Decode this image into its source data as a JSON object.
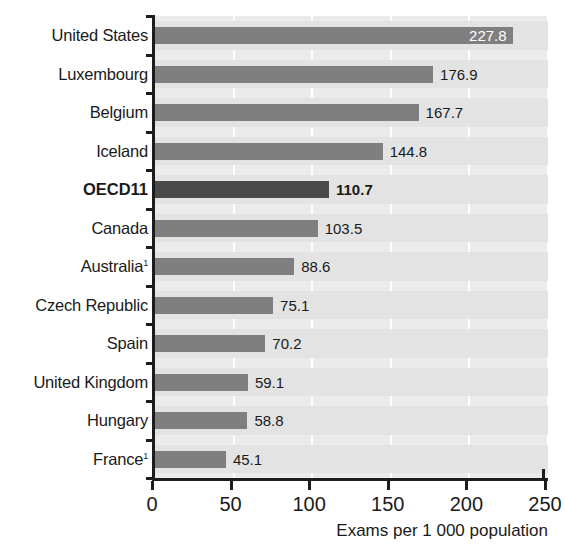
{
  "chart_data": {
    "type": "bar",
    "orientation": "horizontal",
    "title": "",
    "subtitle": "",
    "xlabel": "Exams per 1 000 population",
    "ylabel": "",
    "xlim": [
      0,
      250
    ],
    "xticks": [
      0,
      50,
      100,
      150,
      200,
      250
    ],
    "xtick_labels": [
      "0",
      "50",
      "100",
      "150",
      "200",
      "250"
    ],
    "grid": "vertical-white-gridlines",
    "legend": "none",
    "categories": [
      "United States",
      "Luxembourg",
      "Belgium",
      "Iceland",
      "OECD11",
      "Canada",
      "Australia",
      "Czech Republic",
      "Spain",
      "United Kingdom",
      "Hungary",
      "France"
    ],
    "values": [
      227.8,
      176.9,
      167.7,
      144.8,
      110.7,
      103.5,
      88.6,
      75.1,
      70.2,
      59.1,
      58.8,
      45.1
    ],
    "value_labels": [
      "227.8",
      "176.9",
      "167.7",
      "144.8",
      "110.7",
      "103.5",
      "88.6",
      "75.1",
      "70.2",
      "59.1",
      "58.8",
      "45.1"
    ],
    "footnote_markers": [
      "",
      "",
      "",
      "",
      "",
      "",
      "1",
      "",
      "",
      "",
      "",
      "1"
    ],
    "highlighted": [
      "OECD11"
    ],
    "label_inside_bar": [
      "United States"
    ],
    "bar_color": "#7f7f7f",
    "highlight_bar_color": "#4a4a4a",
    "plot_background": "#ebebeb",
    "band_color": "#e3e3e3",
    "gridline_color": "#ffffff",
    "axis_color": "#1d1d1d",
    "text_color": "#1a1a1a",
    "inside_label_color": "#ffffff"
  }
}
